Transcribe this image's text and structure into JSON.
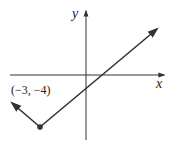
{
  "diagram": {
    "type": "absolute-value-graph",
    "axes": {
      "x_label": "x",
      "y_label": "y"
    },
    "vertex": {
      "x": -3,
      "y": -4,
      "label": "(−3, −4)"
    },
    "colors": {
      "line": "#333333",
      "axis": "#333333",
      "background": "#ffffff"
    }
  }
}
